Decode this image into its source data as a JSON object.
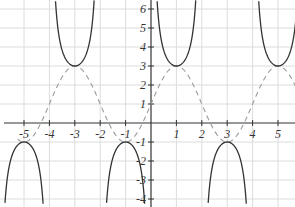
{
  "chart_data": {
    "type": "line",
    "title": "",
    "xlabel": "",
    "ylabel": "",
    "xlim": [
      -6,
      5.75
    ],
    "ylim": [
      -4.3,
      6.5
    ],
    "grid": true,
    "x_ticks": [
      -5,
      -4,
      -3,
      -2,
      -1,
      1,
      2,
      3,
      4,
      5
    ],
    "x_tick_labels": [
      "-5",
      "-4",
      "-3",
      "-2",
      "-1",
      "1",
      "2",
      "3",
      "4",
      "5"
    ],
    "y_ticks": [
      6,
      5,
      4,
      3,
      2,
      1,
      -1,
      -2,
      -3,
      -4
    ],
    "y_tick_labels": [
      "6",
      "5",
      "4",
      "3",
      "2",
      "1",
      "-1",
      "-2",
      "-3",
      "-4"
    ],
    "series": [
      {
        "name": "y = 2 sin(πx/2) + 1",
        "style": "dashed",
        "color": "#9a9a9a",
        "amplitude": 2,
        "period": 4,
        "vertical_shift": 1,
        "key_points": [
          [
            -5,
            -1
          ],
          [
            -3,
            3
          ],
          [
            -1,
            -1
          ],
          [
            0,
            1
          ],
          [
            1,
            3
          ],
          [
            3,
            -1
          ],
          [
            5,
            3
          ]
        ]
      },
      {
        "name": "y = 2 csc(πx/2) + 1",
        "style": "solid",
        "color": "#333333",
        "amplitude": 2,
        "period": 4,
        "vertical_shift": 1,
        "asymptotes": [
          -4,
          -2,
          0,
          2,
          4
        ],
        "vertices": [
          [
            -5,
            -1
          ],
          [
            -3,
            3
          ],
          [
            -1,
            -1
          ],
          [
            1,
            3
          ],
          [
            3,
            -1
          ],
          [
            5,
            3
          ]
        ]
      }
    ]
  }
}
